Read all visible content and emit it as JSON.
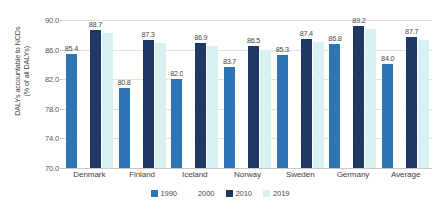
{
  "chart_data": {
    "type": "bar",
    "title": "",
    "subtitle": "",
    "xlabel": "",
    "ylabel_lines": [
      "DALYs accountable to NCDs",
      "(% of all DALYs)"
    ],
    "ylabel": "DALYs accountable to NCDs (% of all DALYs)",
    "ylim": [
      70.0,
      90.0
    ],
    "yticks": [
      "90.0",
      "86.0",
      "82.0",
      "78.0",
      "74.0",
      "70.0"
    ],
    "ytick_values": [
      90.0,
      86.0,
      82.0,
      78.0,
      74.0,
      70.0
    ],
    "grid": true,
    "legend_position": "bottom",
    "categories": [
      "Denmark",
      "Finland",
      "Iceland",
      "Norway",
      "Sweden",
      "Germany",
      "Average"
    ],
    "series": [
      {
        "name": "1990",
        "color": "#2E75B6",
        "values": [
          85.4,
          80.8,
          82.0,
          83.7,
          85.3,
          86.8,
          84.0
        ],
        "labels": [
          "85.4",
          "80.8",
          "82.0",
          "83.7",
          "85.3",
          "86.8",
          "84.0"
        ]
      },
      {
        "name": "2000",
        "color": "#FFFFFF",
        "values": [
          85.0,
          81.6,
          83.1,
          84.3,
          85.6,
          87.0,
          84.4
        ],
        "labels": [
          "",
          "",
          "",
          "",
          "",
          "",
          ""
        ]
      },
      {
        "name": "2010",
        "color": "#1F3864",
        "values": [
          88.7,
          87.3,
          86.9,
          86.5,
          87.4,
          89.2,
          87.7
        ],
        "labels": [
          "88.7",
          "87.3",
          "86.9",
          "86.5",
          "87.4",
          "89.2",
          "87.7"
        ]
      },
      {
        "name": "2019",
        "color": "#D7F2F0",
        "values": [
          88.2,
          86.9,
          86.5,
          86.0,
          87.0,
          88.8,
          87.3
        ],
        "labels": [
          "",
          "",
          "",
          "",
          "",
          "",
          ""
        ]
      }
    ]
  },
  "legend": {
    "items": [
      {
        "label": "1990",
        "color": "#2E75B6"
      },
      {
        "label": "2000",
        "color": "#FDFDFD"
      },
      {
        "label": "2010",
        "color": "#1F3864"
      },
      {
        "label": "2019",
        "color": "#D7F2F0"
      }
    ]
  },
  "colors": {
    "series_1990": "#2E75B6",
    "series_2000": "#FFFFFF",
    "series_2010": "#1F3864",
    "series_2019": "#D7F2F0",
    "gridline": "#E2E2E2",
    "text": "#3F3F3F"
  }
}
